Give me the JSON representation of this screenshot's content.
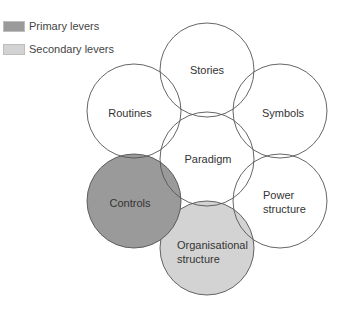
{
  "legend": {
    "items": [
      {
        "label": "Primary levers",
        "color": "#9a9a9a"
      },
      {
        "label": "Secondary levers",
        "color": "#d3d3d3"
      }
    ]
  },
  "diagram": {
    "stroke_color": "#555555",
    "circles": [
      {
        "id": "stories",
        "label_lines": [
          "Stories"
        ],
        "fill": "none"
      },
      {
        "id": "routines",
        "label_lines": [
          "Routines"
        ],
        "fill": "none"
      },
      {
        "id": "symbols",
        "label_lines": [
          "Symbols"
        ],
        "fill": "none"
      },
      {
        "id": "paradigm",
        "label_lines": [
          "Paradigm"
        ],
        "fill": "none"
      },
      {
        "id": "controls",
        "label_lines": [
          "Controls"
        ],
        "fill": "#9a9a9a",
        "lever": "primary"
      },
      {
        "id": "power-structure",
        "label_lines": [
          "Power",
          "structure"
        ],
        "fill": "none"
      },
      {
        "id": "organisational-structure",
        "label_lines": [
          "Organisational",
          "structure"
        ],
        "fill": "#d3d3d3",
        "lever": "secondary"
      }
    ]
  }
}
